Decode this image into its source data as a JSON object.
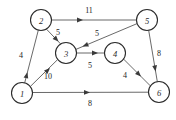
{
  "figure": {
    "type": "directed-weighted-graph",
    "width": 176,
    "height": 120,
    "background_color": "#ffffff",
    "node_stroke_color": "#2b2b2b",
    "edge_stroke_color": "#585858",
    "label_color": "#1c1c1c"
  },
  "nodes": [
    {
      "id": "1",
      "label": "1",
      "cx": 22,
      "cy": 93,
      "r": 10.5
    },
    {
      "id": "2",
      "label": "2",
      "cx": 41,
      "cy": 20,
      "r": 10.5
    },
    {
      "id": "3",
      "label": "3",
      "cx": 66,
      "cy": 53,
      "r": 10.5
    },
    {
      "id": "4",
      "label": "4",
      "cx": 115,
      "cy": 53,
      "r": 10.5
    },
    {
      "id": "5",
      "label": "5",
      "cx": 147,
      "cy": 20,
      "r": 10.5
    },
    {
      "id": "6",
      "label": "6",
      "cx": 159,
      "cy": 92,
      "r": 10.5
    }
  ],
  "edges": [
    {
      "from": "2",
      "to": "5",
      "weight": "11",
      "label_x": 89,
      "label_y": 10,
      "x1": 51.5,
      "y1": 20,
      "x2": 136.5,
      "y2": 20,
      "ax": 83,
      "ay": 20,
      "angle": 0
    },
    {
      "from": "2",
      "to": "3",
      "weight": "5",
      "label_x": 58,
      "label_y": 32,
      "x1": 46.6,
      "y1": 29.3,
      "x2": 60.4,
      "y2": 43.7,
      "ax": 58.5,
      "ay": 41.6,
      "angle": 46
    },
    {
      "from": "1",
      "to": "2",
      "weight": "4",
      "label_x": 21,
      "label_y": 55,
      "x1": 24.7,
      "y1": 82.8,
      "x2": 38.3,
      "y2": 30.2,
      "ax": 27.4,
      "ay": 72.2,
      "angle": -75.5
    },
    {
      "from": "5",
      "to": "3",
      "weight": "5",
      "label_x": 97,
      "label_y": 33,
      "x1": 137.1,
      "y1": 23.6,
      "x2": 75.9,
      "y2": 49.4,
      "ax": 82.5,
      "ay": 46.6,
      "angle": 157
    },
    {
      "from": "3",
      "to": "4",
      "weight": "5",
      "label_x": 90,
      "label_y": 65,
      "x1": 76.5,
      "y1": 53,
      "x2": 104.5,
      "y2": 53,
      "ax": 98,
      "ay": 53,
      "angle": 0
    },
    {
      "from": "5",
      "to": "6",
      "weight": "8",
      "label_x": 159,
      "label_y": 53,
      "x1": 148.7,
      "y1": 30.4,
      "x2": 157.3,
      "y2": 81.6,
      "ax": 155.6,
      "ay": 71.4,
      "angle": 80.5
    },
    {
      "from": "4",
      "to": "6",
      "weight": "4",
      "label_x": 125,
      "label_y": 75,
      "x1": 123.6,
      "y1": 59.1,
      "x2": 150.4,
      "y2": 85.9,
      "ax": 141,
      "ay": 76.5,
      "angle": 45
    },
    {
      "from": "1",
      "to": "3",
      "weight": "10",
      "label_x": 48,
      "label_y": 76,
      "x1": 30.5,
      "y1": 86.3,
      "x2": 57.5,
      "y2": 59.7,
      "ax": 50,
      "ay": 68,
      "angle": -44.5
    },
    {
      "from": "1",
      "to": "6",
      "weight": "8",
      "label_x": 90,
      "label_y": 103,
      "x1": 32.5,
      "y1": 92.5,
      "x2": 148.5,
      "y2": 92.2,
      "ax": 90,
      "ay": 92.4,
      "angle": 0
    }
  ]
}
